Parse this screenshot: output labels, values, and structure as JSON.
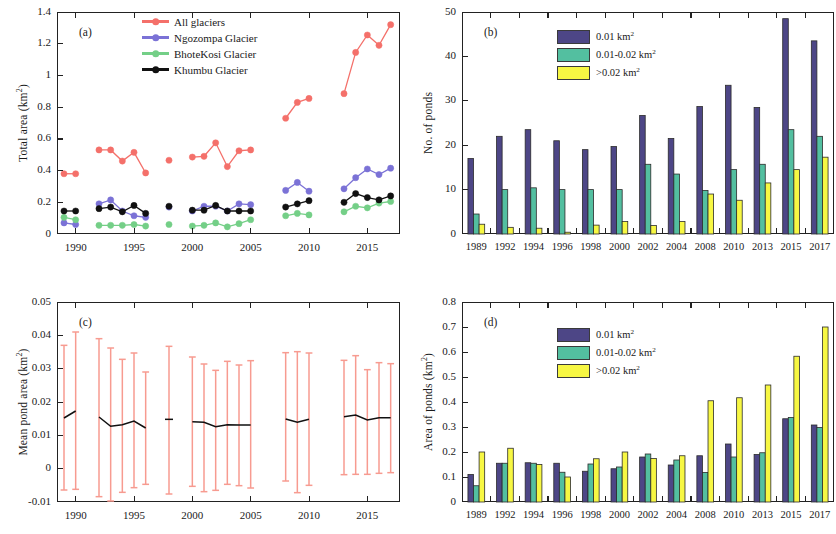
{
  "figure": {
    "panels": [
      "(a)",
      "(b)",
      "(c)",
      "(d)"
    ]
  },
  "chart_data": [
    {
      "type": "line",
      "panel": "(a)",
      "title": "",
      "xlabel": "",
      "ylabel": "Total area (km²)",
      "ylabel_plain": "Total area (km",
      "ylabel_unit": "2",
      "xlim": [
        1988.4,
        2017.8
      ],
      "ylim": [
        0,
        1.4
      ],
      "yticks": [
        0,
        0.2,
        0.4,
        0.6,
        0.8,
        1,
        1.2,
        1.4
      ],
      "ytick_labels": [
        "0",
        "0.2",
        "0.4",
        "0.6",
        "0.8",
        "1",
        "1.2",
        "1.4"
      ],
      "xticks": [
        1990,
        1995,
        2000,
        2005,
        2010,
        2015
      ],
      "xtick_labels": [
        "1990",
        "1995",
        "2000",
        "2005",
        "2010",
        "2015"
      ],
      "grid": false,
      "legend_position": "top-center",
      "series": [
        {
          "name": "All glaciers",
          "color": "#f4706a",
          "x": [
            1989,
            1990,
            1992,
            1993,
            1994,
            1995,
            1996,
            1998,
            2000,
            2001,
            2002,
            2003,
            2004,
            2005,
            2008,
            2009,
            2010,
            2013,
            2014,
            2015,
            2016,
            2017
          ],
          "values": [
            0.38,
            0.38,
            0.53,
            0.53,
            0.46,
            0.515,
            0.385,
            0.465,
            0.485,
            0.49,
            0.575,
            0.425,
            0.525,
            0.53,
            0.73,
            0.83,
            0.855,
            0.885,
            1.145,
            1.255,
            1.19,
            1.32
          ]
        },
        {
          "name": "Ngozompa Glacier",
          "color": "#7b72d6",
          "x": [
            1989,
            1990,
            1992,
            1993,
            1994,
            1995,
            1996,
            1998,
            2000,
            2001,
            2002,
            2003,
            2004,
            2005,
            2008,
            2009,
            2010,
            2013,
            2014,
            2015,
            2016,
            2017
          ],
          "values": [
            0.07,
            0.06,
            0.19,
            0.215,
            0.145,
            0.115,
            0.105,
            0.17,
            0.145,
            0.175,
            0.175,
            0.145,
            0.19,
            0.185,
            0.275,
            0.325,
            0.27,
            0.285,
            0.355,
            0.41,
            0.375,
            0.415
          ]
        },
        {
          "name": "BhoteKosi Glacier",
          "color": "#74cf87",
          "x": [
            1989,
            1990,
            1992,
            1993,
            1994,
            1995,
            1996,
            1998,
            2000,
            2001,
            2002,
            2003,
            2004,
            2005,
            2008,
            2009,
            2010,
            2013,
            2014,
            2015,
            2016,
            2017
          ],
          "values": [
            0.105,
            0.09,
            0.055,
            0.055,
            0.055,
            0.06,
            0.05,
            0.06,
            0.05,
            0.055,
            0.07,
            0.045,
            0.065,
            0.09,
            0.115,
            0.13,
            0.12,
            0.14,
            0.175,
            0.165,
            0.195,
            0.205
          ]
        },
        {
          "name": "Khumbu Glacier",
          "color": "#111111",
          "x": [
            1989,
            1990,
            1992,
            1993,
            1994,
            1995,
            1996,
            1998,
            2000,
            2001,
            2002,
            2003,
            2004,
            2005,
            2008,
            2009,
            2010,
            2013,
            2014,
            2015,
            2016,
            2017
          ],
          "values": [
            0.145,
            0.145,
            0.16,
            0.17,
            0.14,
            0.18,
            0.13,
            0.175,
            0.15,
            0.15,
            0.18,
            0.145,
            0.145,
            0.145,
            0.17,
            0.19,
            0.21,
            0.2,
            0.255,
            0.23,
            0.215,
            0.24
          ]
        }
      ]
    },
    {
      "type": "bar",
      "panel": "(b)",
      "title": "",
      "xlabel": "",
      "ylabel": "No. of ponds",
      "categories": [
        "1989",
        "1992",
        "1994",
        "1996",
        "1998",
        "2000",
        "2002",
        "2004",
        "2008",
        "2010",
        "2013",
        "2015",
        "2017"
      ],
      "ylim": [
        0,
        50
      ],
      "yticks": [
        0,
        10,
        20,
        30,
        40,
        50
      ],
      "ytick_labels": [
        "0",
        "10",
        "20",
        "30",
        "40",
        "50"
      ],
      "grid": false,
      "legend_position": "top-center",
      "series": [
        {
          "name": "0.01 km²",
          "color": "#4d4686",
          "values": [
            17,
            22,
            23.5,
            21,
            19,
            19.7,
            26.7,
            21.5,
            28.7,
            33.5,
            28.5,
            48.5,
            43.5
          ]
        },
        {
          "name": "0.01-0.02 km²",
          "color": "#53bfa0",
          "values": [
            4.5,
            10,
            10.4,
            10,
            10,
            10,
            15.7,
            13.5,
            9.8,
            14.5,
            15.7,
            23.5,
            22
          ]
        },
        {
          "name": ">0.02 km²",
          "color": "#f7f743",
          "values": [
            2.2,
            1.5,
            1.3,
            0.4,
            2,
            2.8,
            1.9,
            2.8,
            9,
            7.6,
            11.5,
            14.5,
            17.3
          ]
        }
      ]
    },
    {
      "type": "line",
      "panel": "(c)",
      "title": "",
      "xlabel": "",
      "ylabel": "Mean pond area (km²)",
      "xlim": [
        1988.4,
        2017.8
      ],
      "ylim": [
        -0.01,
        0.05
      ],
      "yticks": [
        -0.01,
        0,
        0.01,
        0.02,
        0.03,
        0.04,
        0.05
      ],
      "ytick_labels": [
        "-0.01",
        "0",
        "0.01",
        "0.02",
        "0.03",
        "0.04",
        "0.05"
      ],
      "xticks": [
        1990,
        1995,
        2000,
        2005,
        2010,
        2015
      ],
      "xtick_labels": [
        "1990",
        "1995",
        "2000",
        "2005",
        "2010",
        "2015"
      ],
      "grid": false,
      "error_color": "#f79b90",
      "line_color": "#111111",
      "series": [
        {
          "name": "Mean pond area",
          "x": [
            1989,
            1990,
            1992,
            1993,
            1994,
            1995,
            1996,
            1998,
            2000,
            2001,
            2002,
            2003,
            2004,
            2005,
            2008,
            2009,
            2010,
            2013,
            2014,
            2015,
            2016,
            2017
          ],
          "values": [
            0.0152,
            0.0173,
            0.0155,
            0.0127,
            0.0132,
            0.0143,
            0.0122,
            0.0148,
            0.0141,
            0.0139,
            0.0126,
            0.0132,
            0.0131,
            0.0131,
            0.0149,
            0.0139,
            0.0148,
            0.0156,
            0.0161,
            0.0146,
            0.0153,
            0.0153
          ],
          "err_upper": [
            0.037,
            0.041,
            0.039,
            0.0362,
            0.0328,
            0.0347,
            0.029,
            0.0367,
            0.0335,
            0.0314,
            0.0295,
            0.0322,
            0.0311,
            0.0324,
            0.0348,
            0.0351,
            0.0347,
            0.0325,
            0.0339,
            0.0297,
            0.0318,
            0.0315
          ],
          "err_lower": [
            -0.0064,
            -0.0062,
            -0.0084,
            -0.0097,
            -0.0071,
            -0.0057,
            -0.0047,
            -0.0076,
            -0.0053,
            -0.0069,
            -0.0065,
            -0.0047,
            -0.0051,
            -0.0058,
            -0.0037,
            -0.0072,
            -0.005,
            -0.0018,
            -0.0017,
            -0.0017,
            -0.0014,
            -0.0012
          ]
        }
      ]
    },
    {
      "type": "bar",
      "panel": "(d)",
      "title": "",
      "xlabel": "",
      "ylabel": "Area of ponds (km²)",
      "categories": [
        "1989",
        "1992",
        "1994",
        "1996",
        "1998",
        "2000",
        "2002",
        "2004",
        "2008",
        "2010",
        "2013",
        "2015",
        "2017"
      ],
      "ylim": [
        0,
        0.8
      ],
      "yticks": [
        0,
        0.1,
        0.2,
        0.3,
        0.4,
        0.5,
        0.6,
        0.7,
        0.8
      ],
      "ytick_labels": [
        "0",
        "0.1",
        "0.2",
        "0.3",
        "0.4",
        "0.5",
        "0.6",
        "0.7",
        "0.8"
      ],
      "grid": false,
      "legend_position": "top-center",
      "series": [
        {
          "name": "0.01 km²",
          "color": "#4d4686",
          "values": [
            0.11,
            0.155,
            0.157,
            0.155,
            0.123,
            0.133,
            0.18,
            0.148,
            0.185,
            0.232,
            0.19,
            0.333,
            0.308
          ]
        },
        {
          "name": "0.01-0.02 km²",
          "color": "#53bfa0",
          "values": [
            0.065,
            0.155,
            0.155,
            0.119,
            0.152,
            0.14,
            0.192,
            0.168,
            0.118,
            0.18,
            0.197,
            0.338,
            0.298
          ]
        },
        {
          "name": ">0.02 km²",
          "color": "#f7f743",
          "values": [
            0.2,
            0.215,
            0.15,
            0.1,
            0.173,
            0.2,
            0.174,
            0.185,
            0.405,
            0.417,
            0.468,
            0.583,
            0.7
          ]
        }
      ]
    }
  ],
  "panel_a_legend": [
    {
      "label": "All glaciers",
      "color": "#f4706a"
    },
    {
      "label": "Ngozompa Glacier",
      "color": "#7b72d6"
    },
    {
      "label": "BhoteKosi Glacier",
      "color": "#74cf87"
    },
    {
      "label": "Khumbu Glacier",
      "color": "#111111"
    }
  ],
  "bar_legend": [
    {
      "label": "0.01 km2",
      "color": "#4d4686"
    },
    {
      "label": "0.01-0.02 km2",
      "color": "#53bfa0"
    },
    {
      "label": ">0.02 km2",
      "color": "#f7f743"
    }
  ]
}
